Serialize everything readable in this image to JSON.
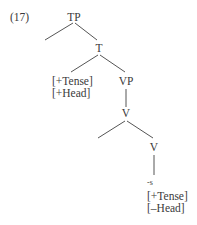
{
  "example_number": "(17)",
  "tree": {
    "root": {
      "label": "TP"
    },
    "t_node": {
      "label": "T"
    },
    "t_features": [
      "[+Tense]",
      "[+Head]"
    ],
    "vp_node": {
      "label": "VP"
    },
    "v_upper": {
      "label": "V"
    },
    "v_lower": {
      "label": "V"
    },
    "suffix": "-s",
    "suffix_features": [
      "[+Tense]",
      "[–Head]"
    ]
  },
  "edges": [
    {
      "from": "TP",
      "to": "empty-left"
    },
    {
      "from": "TP",
      "to": "T"
    },
    {
      "from": "T",
      "to": "T-features"
    },
    {
      "from": "T",
      "to": "VP"
    },
    {
      "from": "VP",
      "to": "V"
    },
    {
      "from": "V",
      "to": "empty-left"
    },
    {
      "from": "V",
      "to": "V-lower"
    },
    {
      "from": "V-lower",
      "to": "-s"
    }
  ],
  "colors": {
    "text": "#3a3a3a",
    "lines": "#555555",
    "background": "#ffffff"
  }
}
